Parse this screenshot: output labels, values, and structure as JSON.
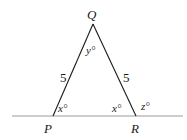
{
  "diagram": {
    "type": "isosceles-triangle-with-exterior-angle",
    "vertices": {
      "Q": {
        "label": "Q",
        "x": 93,
        "y": 24
      },
      "P": {
        "label": "P",
        "x": 53,
        "y": 116
      },
      "R": {
        "label": "R",
        "x": 136,
        "y": 116
      }
    },
    "baseline": {
      "x1": 12,
      "x2": 183,
      "y": 116
    },
    "side_labels": {
      "PQ": "5",
      "QR": "5"
    },
    "angle_labels": {
      "Q_interior": "y°",
      "P_interior": "x°",
      "R_interior": "x°",
      "R_exterior": "z°"
    },
    "colors": {
      "line": "#1a1a1a",
      "baseline": "#9a9a9a",
      "text": "#1a1a1a"
    }
  }
}
